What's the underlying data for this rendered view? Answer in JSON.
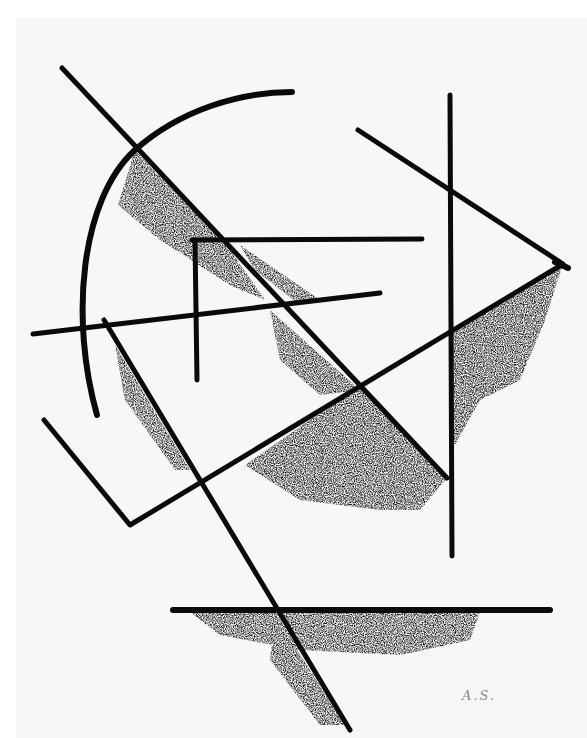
{
  "artwork": {
    "description": "Abstract geometric ink drawing with intersecting lines, arc, triangle and smudged shading",
    "signature": "A.S.",
    "ink_color": "#0a0a0a",
    "paper_color": "#f7f7f7"
  }
}
